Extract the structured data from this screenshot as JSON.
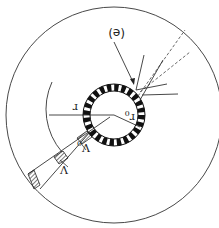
{
  "figure": {
    "orientation": "rotated-180",
    "labels": {
      "panel": "(e)",
      "radius": "r",
      "inner_radius": "r0",
      "inner_radius_base": "r",
      "inner_radius_sub": "0",
      "volume": "V",
      "volume0": "V0",
      "volume0_base": "V",
      "volume0_sub": "0"
    },
    "geometry": {
      "center": [
        114,
        115
      ],
      "outer_circle_radius": 108,
      "ring_outer_radius": 31,
      "ring_inner_radius": 24,
      "ring_segments": 24,
      "arc_radius": 65
    },
    "colors": {
      "line": "#222222",
      "ring_dark": "#111111",
      "ring_light": "#ffffff",
      "background": "#ffffff"
    }
  }
}
